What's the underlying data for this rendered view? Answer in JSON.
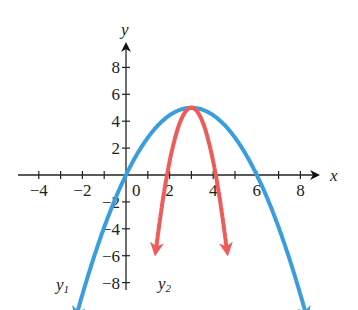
{
  "chart_data": {
    "type": "line",
    "title": "",
    "xlabel": "x",
    "ylabel": "y",
    "xlim": [
      -4.5,
      9
    ],
    "ylim": [
      -8.5,
      9
    ],
    "x_ticks": [
      -4,
      -2,
      0,
      2,
      4,
      6,
      8
    ],
    "x_tick_labels": [
      "−4",
      "−2",
      "0",
      "2",
      "4",
      "6",
      "8"
    ],
    "y_ticks": [
      -8,
      -6,
      -4,
      -2,
      2,
      4,
      6,
      8
    ],
    "y_tick_labels": [
      "−8",
      "−6",
      "−4",
      "−2",
      "2",
      "4",
      "6",
      "8"
    ],
    "grid": false,
    "series": [
      {
        "name": "y1",
        "label": "y1",
        "color": "#3a9ede",
        "equation": "y = -(5/9)(x-3)^2 + 5",
        "vertex": [
          3,
          5
        ],
        "x_intercepts": [
          0,
          6
        ],
        "x_range": [
          -2.2,
          8.2
        ]
      },
      {
        "name": "y2",
        "label": "y2",
        "color": "#ef5a5a",
        "equation": "y = -4(x-3)^2 + 5",
        "vertex": [
          3,
          5
        ],
        "x_intercepts": [
          1.9,
          4.1
        ],
        "x_range": [
          1.4,
          4.6
        ]
      }
    ]
  },
  "labels": {
    "x_axis": "x",
    "y_axis": "y",
    "y1": "y",
    "y1_sub": "1",
    "y2": "y",
    "y2_sub": "2"
  }
}
